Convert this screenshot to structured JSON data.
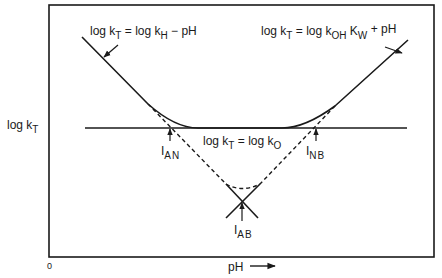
{
  "diagram": {
    "type": "pH-rate profile",
    "y_axis_label": {
      "main": "log k",
      "sub": "T"
    },
    "x_axis_label": "pH",
    "x_axis_arrow": "right-arrow",
    "origin_label": "0",
    "equations": {
      "acid": {
        "lhs": "log k",
        "lhs_sub": "T",
        "mid": " = log k",
        "mid_sub": "H",
        "rhs": " − pH"
      },
      "base": {
        "lhs": "log k",
        "lhs_sub": "T",
        "mid": " = log k",
        "mid_sub": "OH",
        "k2": " K",
        "k2_sub": "W",
        "rhs": " + pH"
      },
      "neutral": {
        "lhs": "log k",
        "lhs_sub": "T",
        "mid": " = log k",
        "mid_sub": "O"
      }
    },
    "intersections": [
      {
        "id": "AN",
        "label": "I",
        "sub": "AN"
      },
      {
        "id": "NB",
        "label": "I",
        "sub": "NB"
      },
      {
        "id": "AB",
        "label": "I",
        "sub": "AB"
      }
    ],
    "line_color": "#1a1a1a"
  }
}
